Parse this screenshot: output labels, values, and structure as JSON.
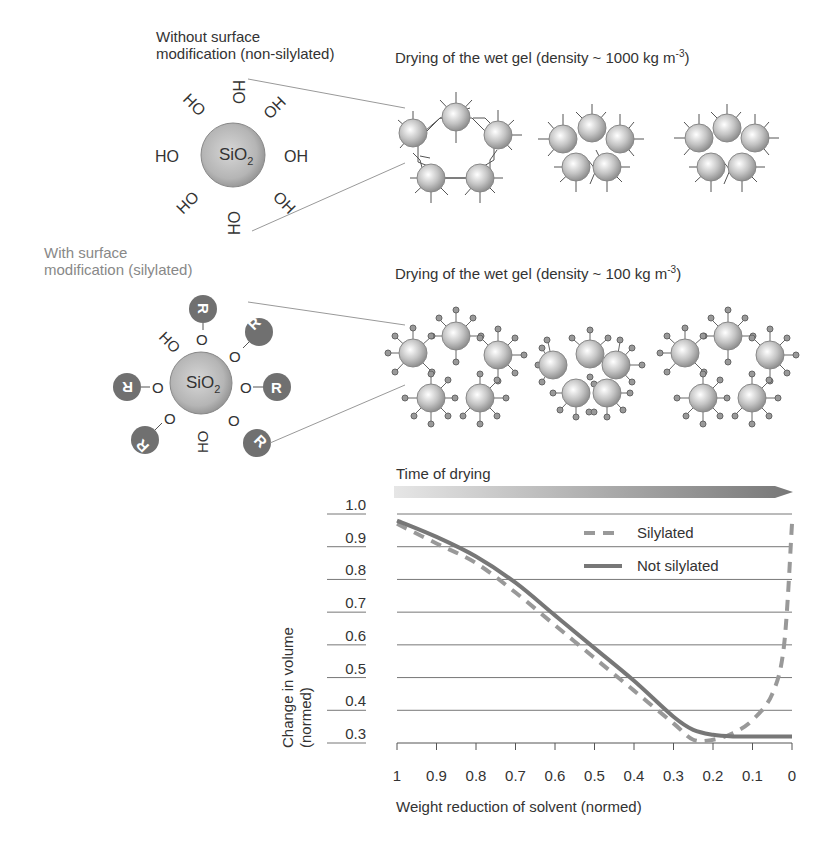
{
  "top_section": {
    "label_line1": "Without surface",
    "label_line2": "modification (non-silylated)",
    "title": "Drying of the wet gel (density ~ 1000 kg m",
    "title_sup": "-3",
    "title_end": ")",
    "particle": {
      "core": "SiO",
      "core_sub": "2",
      "groups": [
        "OH",
        "OH",
        "OH",
        "OH",
        "OH",
        "OH",
        "OH",
        "OH"
      ]
    }
  },
  "bottom_section": {
    "label_line1": "With surface",
    "label_line2": "modification (silylated)",
    "title": "Drying of the wet gel (density ~ 100 kg m",
    "title_sup": "-3",
    "title_end": ")",
    "particle": {
      "core": "SiO",
      "core_sub": "2",
      "groups": [
        "O-R",
        "O-R",
        "O-R",
        "O-R",
        "O-R",
        "O-R",
        "OH",
        "OH"
      ],
      "r_label": "R",
      "o_label": "O",
      "oh_label": "OH"
    }
  },
  "time_arrow": {
    "label": "Time of drying"
  },
  "chart_data": {
    "type": "line",
    "title": "",
    "xlabel": "Weight reduction of solvent (normed)",
    "ylabel_line1": "Change in volume",
    "ylabel_line2": "(normed)",
    "x_ticks": [
      "1",
      "0.9",
      "0.8",
      "0.7",
      "0.6",
      "0.5",
      "0.4",
      "0.3",
      "0.2",
      "0.1",
      "0"
    ],
    "y_ticks": [
      "1.0",
      "0.9",
      "0.8",
      "0.7",
      "0.6",
      "0.5",
      "0.4",
      "0.3"
    ],
    "xlim": [
      1,
      0
    ],
    "ylim": [
      0.3,
      1.0
    ],
    "grid": true,
    "legend_position": "upper-right",
    "series": [
      {
        "name": "Silylated",
        "style": "dashed",
        "color": "#999999",
        "x": [
          1.0,
          0.9,
          0.8,
          0.7,
          0.6,
          0.5,
          0.4,
          0.3,
          0.25,
          0.2,
          0.15,
          0.1,
          0.05,
          0.02,
          0.0
        ],
        "y": [
          0.97,
          0.91,
          0.85,
          0.76,
          0.66,
          0.56,
          0.46,
          0.36,
          0.31,
          0.31,
          0.33,
          0.37,
          0.45,
          0.6,
          0.97
        ]
      },
      {
        "name": "Not silylated",
        "style": "solid",
        "color": "#777777",
        "x": [
          1.0,
          0.9,
          0.8,
          0.7,
          0.6,
          0.5,
          0.4,
          0.3,
          0.25,
          0.2,
          0.15,
          0.1,
          0.05,
          0.0
        ],
        "y": [
          0.98,
          0.93,
          0.87,
          0.79,
          0.69,
          0.59,
          0.49,
          0.38,
          0.34,
          0.325,
          0.32,
          0.32,
          0.32,
          0.32
        ]
      }
    ]
  }
}
